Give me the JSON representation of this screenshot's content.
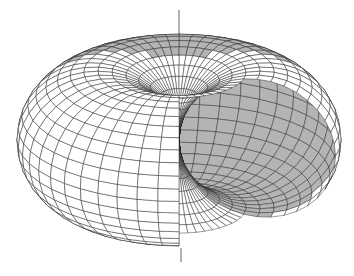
{
  "figure": {
    "colors": {
      "background": "#ffffff",
      "wire": "#222222",
      "cutaway_fill": "#b4b4b4"
    }
  }
}
